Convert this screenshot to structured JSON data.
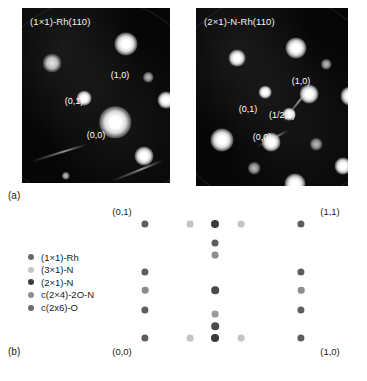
{
  "figure": {
    "panel_a_letter": "(a)",
    "panel_b_letter": "(b)"
  },
  "leed_images": [
    {
      "title": "(1×1)-Rh(110)",
      "spot_labels": [
        {
          "text": "(1,0)",
          "x": 98,
          "y": 62
        },
        {
          "text": "(0,1)",
          "x": 52,
          "y": 88
        },
        {
          "text": "(0,0)",
          "x": 74,
          "y": 122
        }
      ]
    },
    {
      "title": "(2×1)-N-Rh(110)",
      "spot_labels": [
        {
          "text": "(1,0)",
          "x": 105,
          "y": 68
        },
        {
          "text": "(0,1)",
          "x": 52,
          "y": 96
        },
        {
          "text": "(1/2,0)",
          "x": 86,
          "y": 102
        },
        {
          "text": "(0,0)",
          "x": 66,
          "y": 124
        }
      ]
    }
  ],
  "legend": {
    "items": [
      {
        "label": "(1×1)-Rh",
        "color": "#6b6b6b"
      },
      {
        "label": "(3×1)-N",
        "color": "#c4c4c4"
      },
      {
        "label": "(2×1)-N",
        "color": "#3a3a3a"
      },
      {
        "label": "c(2×4)-2O-N",
        "color": "#8e8e8e"
      },
      {
        "label": "c(2x6)-O",
        "color": "#6b6b6b"
      }
    ]
  },
  "schematic": {
    "labels": [
      {
        "text": "(0,1)",
        "x": 122,
        "y": 8
      },
      {
        "text": "(1,1)",
        "x": 330,
        "y": 8
      },
      {
        "text": "(0,0)",
        "x": 122,
        "y": 148
      },
      {
        "text": "(1,0)",
        "x": 330,
        "y": 148
      }
    ],
    "colors": {
      "rh": "#6b6b6b",
      "n3x1": "#c4c4c4",
      "n2x1": "#3a3a3a",
      "c2x4": "#8e8e8e",
      "c2x6": "#6b6b6b"
    },
    "dots": [
      {
        "x": 145,
        "y": 26,
        "r": 3.6,
        "color": "#5d5d5d"
      },
      {
        "x": 190,
        "y": 26,
        "r": 3.4,
        "color": "#c4c4c4"
      },
      {
        "x": 215,
        "y": 26,
        "r": 4.0,
        "color": "#3a3a3a"
      },
      {
        "x": 241,
        "y": 26,
        "r": 3.4,
        "color": "#c4c4c4"
      },
      {
        "x": 301,
        "y": 26,
        "r": 3.6,
        "color": "#5d5d5d"
      },
      {
        "x": 215,
        "y": 45,
        "r": 3.5,
        "color": "#5d5d5d"
      },
      {
        "x": 215,
        "y": 57,
        "r": 3.4,
        "color": "#8e8e8e"
      },
      {
        "x": 145,
        "y": 74,
        "r": 3.6,
        "color": "#5d5d5d"
      },
      {
        "x": 301,
        "y": 74,
        "r": 3.6,
        "color": "#5d5d5d"
      },
      {
        "x": 145,
        "y": 92,
        "r": 3.3,
        "color": "#8e8e8e"
      },
      {
        "x": 215,
        "y": 92,
        "r": 3.8,
        "color": "#4a4a4a"
      },
      {
        "x": 301,
        "y": 92,
        "r": 3.3,
        "color": "#8e8e8e"
      },
      {
        "x": 145,
        "y": 112,
        "r": 3.6,
        "color": "#5d5d5d"
      },
      {
        "x": 301,
        "y": 112,
        "r": 3.6,
        "color": "#5d5d5d"
      },
      {
        "x": 215,
        "y": 116,
        "r": 3.4,
        "color": "#9a9a9a"
      },
      {
        "x": 215,
        "y": 128,
        "r": 3.8,
        "color": "#4a4a4a"
      },
      {
        "x": 145,
        "y": 140,
        "r": 3.6,
        "color": "#5d5d5d"
      },
      {
        "x": 190,
        "y": 140,
        "r": 3.4,
        "color": "#c4c4c4"
      },
      {
        "x": 215,
        "y": 140,
        "r": 4.0,
        "color": "#3a3a3a"
      },
      {
        "x": 241,
        "y": 140,
        "r": 3.4,
        "color": "#c4c4c4"
      },
      {
        "x": 301,
        "y": 140,
        "r": 3.6,
        "color": "#5d5d5d"
      }
    ]
  },
  "leed_spots": {
    "left": [
      {
        "x": 104,
        "y": 36,
        "size": 11,
        "kind": "spot"
      },
      {
        "x": 30,
        "y": 55,
        "size": 9,
        "kind": "soft"
      },
      {
        "x": 126,
        "y": 69,
        "size": 5,
        "kind": "dim"
      },
      {
        "x": 62,
        "y": 90,
        "size": 7,
        "kind": "spot"
      },
      {
        "x": 144,
        "y": 92,
        "size": 8,
        "kind": "spot"
      },
      {
        "x": 93,
        "y": 114,
        "size": 15,
        "kind": "spot"
      },
      {
        "x": 122,
        "y": 148,
        "size": 9,
        "kind": "spot"
      },
      {
        "x": 44,
        "y": 168,
        "size": 4,
        "kind": "dim"
      }
    ],
    "right": [
      {
        "x": 100,
        "y": 40,
        "size": 10,
        "kind": "spot"
      },
      {
        "x": 41,
        "y": 50,
        "size": 8,
        "kind": "spot"
      },
      {
        "x": 130,
        "y": 56,
        "size": 5,
        "kind": "dim"
      },
      {
        "x": 69,
        "y": 84,
        "size": 6,
        "kind": "spot"
      },
      {
        "x": 113,
        "y": 86,
        "size": 9,
        "kind": "spot"
      },
      {
        "x": 154,
        "y": 88,
        "size": 9,
        "kind": "spot"
      },
      {
        "x": 93,
        "y": 106,
        "size": 6,
        "kind": "spot"
      },
      {
        "x": 26,
        "y": 132,
        "size": 11,
        "kind": "spot"
      },
      {
        "x": 75,
        "y": 134,
        "size": 9,
        "kind": "spot"
      },
      {
        "x": 120,
        "y": 136,
        "size": 6,
        "kind": "dim"
      },
      {
        "x": 58,
        "y": 160,
        "size": 6,
        "kind": "dim"
      },
      {
        "x": 147,
        "y": 158,
        "size": 8,
        "kind": "spot"
      },
      {
        "x": 99,
        "y": 176,
        "size": 10,
        "kind": "spot"
      }
    ]
  }
}
